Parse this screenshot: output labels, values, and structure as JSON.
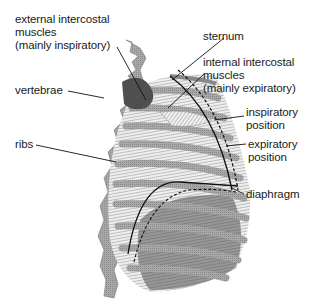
{
  "diagram": {
    "labels": {
      "external_intercostal": [
        "external intercostal",
        "muscles",
        "(mainly inspiratory)"
      ],
      "sternum": "sternum",
      "internal_intercostal": [
        "internal intercostal",
        "muscles",
        "(mainly expiratory)"
      ],
      "vertebrae": "vertebrae",
      "inspiratory_position": [
        "inspiratory",
        "position"
      ],
      "ribs": "ribs",
      "expiratory_position": [
        "expiratory",
        "position"
      ],
      "diaphragm": "diaphragm"
    },
    "colors": {
      "bone": "#9a9a9a",
      "bone_dark": "#6e6e6e",
      "muscle_dark": "#3a3a3a",
      "hatch_light": "#d8d8d8",
      "line": "#111111"
    }
  }
}
